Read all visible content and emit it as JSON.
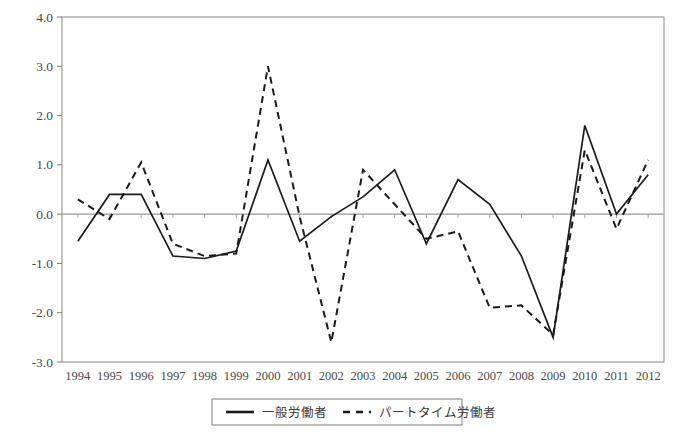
{
  "chart_data": {
    "type": "line",
    "title": "",
    "subtitle": "",
    "xlabel": "",
    "ylabel": "",
    "xlim": [
      1994,
      2012
    ],
    "ylim": [
      -3.0,
      4.0
    ],
    "grid": false,
    "zero_line": true,
    "legend_position": "bottom-center",
    "x": [
      1994,
      1995,
      1996,
      1997,
      1998,
      1999,
      2000,
      2001,
      2002,
      2003,
      2004,
      2005,
      2006,
      2007,
      2008,
      2009,
      2010,
      2011,
      2012
    ],
    "categories": [
      "1994",
      "1995",
      "1996",
      "1997",
      "1998",
      "1999",
      "2000",
      "2001",
      "2002",
      "2003",
      "2004",
      "2005",
      "2006",
      "2007",
      "2008",
      "2009",
      "2010",
      "2011",
      "2012"
    ],
    "y_ticks": [
      -3.0,
      -2.0,
      -1.0,
      0.0,
      1.0,
      2.0,
      3.0,
      4.0
    ],
    "y_tick_labels": [
      "-3.0",
      "-2.0",
      "-1.0",
      "0.0",
      "1.0",
      "2.0",
      "3.0",
      "4.0"
    ],
    "series": [
      {
        "name": "一般労働者",
        "style": "solid",
        "color": "#1a1a1a",
        "values": [
          -0.55,
          0.4,
          0.4,
          -0.85,
          -0.9,
          -0.75,
          1.1,
          -0.55,
          -0.05,
          0.35,
          0.9,
          -0.6,
          0.7,
          0.2,
          -0.85,
          -2.5,
          1.8,
          0.0,
          0.8
        ]
      },
      {
        "name": "パートタイム労働者",
        "style": "dashed",
        "color": "#1a1a1a",
        "values": [
          0.3,
          -0.1,
          1.05,
          -0.6,
          -0.85,
          -0.8,
          3.0,
          -0.05,
          -2.6,
          0.9,
          0.2,
          -0.5,
          -0.35,
          -1.9,
          -1.85,
          -2.45,
          1.3,
          -0.3,
          1.1
        ]
      }
    ]
  },
  "legend": {
    "items": [
      {
        "label": "一般労働者",
        "style": "solid"
      },
      {
        "label": "パートタイム労働者",
        "style": "dashed"
      }
    ]
  }
}
